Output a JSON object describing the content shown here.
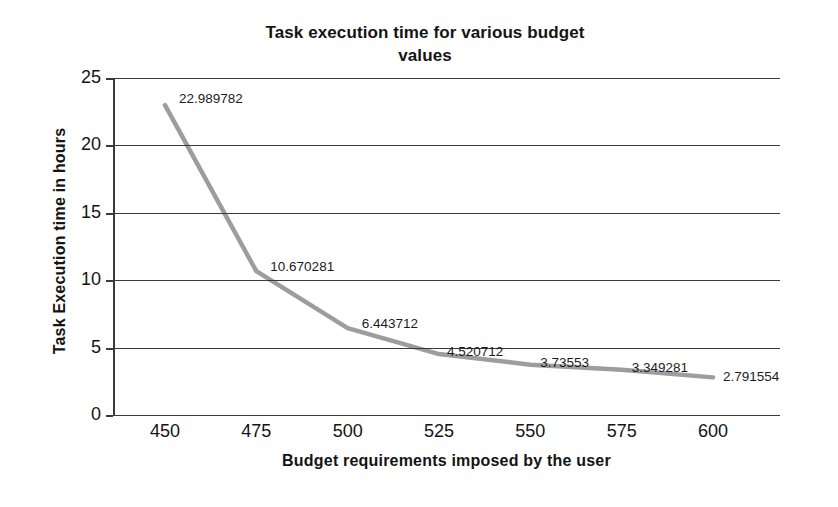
{
  "chart_data": {
    "type": "line",
    "title": "Task execution time for various budget values",
    "title_line1": "Task execution time for various budget",
    "title_line2": "values",
    "xlabel": "Budget requirements imposed by the user",
    "ylabel": "Task Execution time in hours",
    "x": [
      450,
      475,
      500,
      525,
      550,
      575,
      600
    ],
    "values": [
      22.989782,
      10.670281,
      6.443712,
      4.520712,
      3.73553,
      3.349281,
      2.791554
    ],
    "point_labels": [
      "22.989782",
      "10.670281",
      "6.443712",
      "4.520712",
      "3.73553",
      "3.349281",
      "2.791554"
    ],
    "xticks": [
      "450",
      "475",
      "500",
      "525",
      "550",
      "575",
      "600"
    ],
    "yticks": [
      "0",
      "5",
      "10",
      "15",
      "20",
      "25"
    ],
    "xlim": [
      450,
      600
    ],
    "ylim": [
      0,
      25
    ],
    "grid": "horizontal",
    "legend": "none",
    "series_color": "#9d9d9d",
    "axis_color": "#3a3a3a",
    "text_color": "#141414",
    "background": "#ffffff"
  }
}
